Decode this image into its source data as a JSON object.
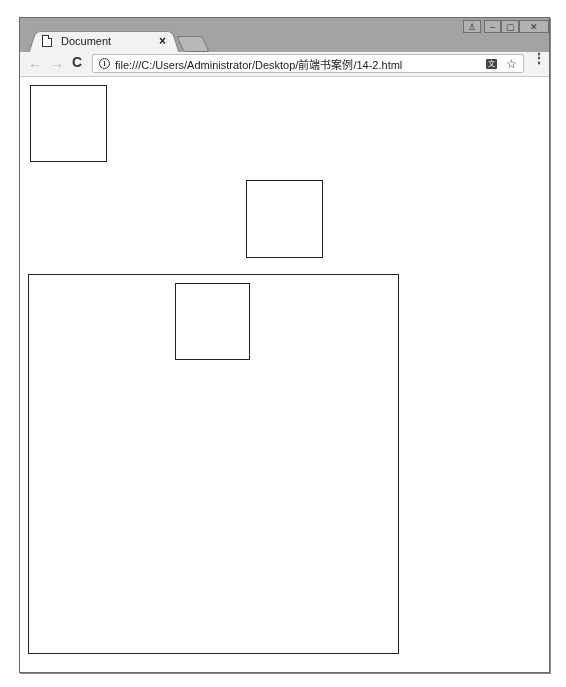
{
  "browser": {
    "tab": {
      "title": "Document",
      "close_label": "×"
    },
    "window_controls": {
      "user": "♙",
      "minimize": "–",
      "maximize": "▢",
      "close": "✕"
    },
    "toolbar": {
      "back": "←",
      "forward": "→",
      "reload": "C",
      "info_icon": "i",
      "url": "file:///C:/Users/Administrator/Desktop/前端书案例/14-2.html",
      "translate_icon": "文",
      "star_icon": "☆",
      "menu_icon": "⋮"
    }
  },
  "page": {
    "boxes": [
      {
        "id": "box-1",
        "left": 10,
        "top": 8,
        "width": 77,
        "height": 77
      },
      {
        "id": "box-2",
        "left": 226,
        "top": 103,
        "width": 77,
        "height": 78
      },
      {
        "id": "container-box",
        "left": 8,
        "top": 197,
        "width": 371,
        "height": 380
      },
      {
        "id": "inner-box",
        "left": 155,
        "top": 206,
        "width": 75,
        "height": 77
      }
    ],
    "border_color": "#222222"
  }
}
